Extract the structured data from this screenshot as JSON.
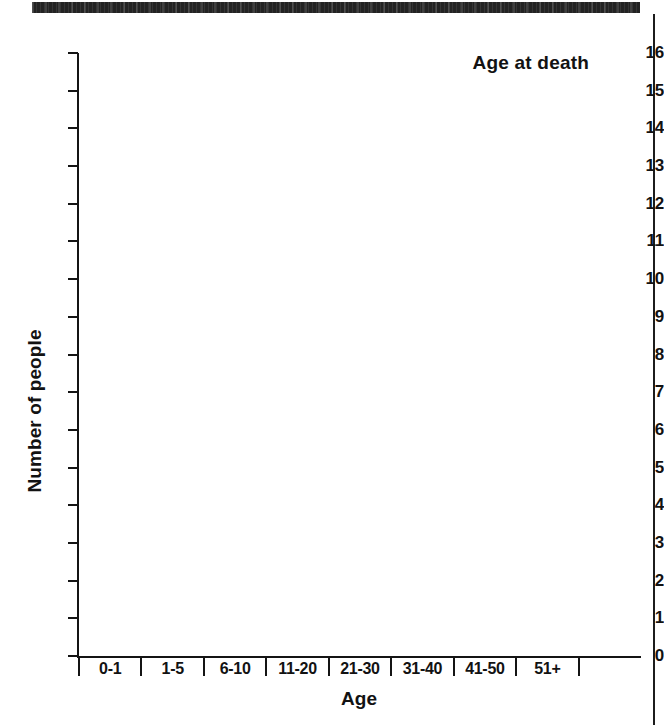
{
  "document": {
    "scan_header_bar": "",
    "right_margin_rule": ""
  },
  "chart_data": {
    "type": "bar",
    "title": "Age at death",
    "xlabel": "Age",
    "ylabel": "Number of people",
    "categories": [
      "0-1",
      "1-5",
      "6-10",
      "11-20",
      "21-30",
      "31-40",
      "41-50",
      "51+"
    ],
    "values": [
      0,
      0,
      0,
      0,
      0,
      0,
      0,
      0
    ],
    "ylim": [
      0,
      16
    ],
    "ytick_labels": [
      "16",
      "15",
      "14",
      "13",
      "12",
      "11",
      "10",
      "9",
      "8",
      "7",
      "6",
      "5",
      "4",
      "3",
      "2",
      "1",
      "0"
    ],
    "ytick_values": [
      16,
      15,
      14,
      13,
      12,
      11,
      10,
      9,
      8,
      7,
      6,
      5,
      4,
      3,
      2,
      1,
      0
    ],
    "grid": false,
    "legend": null
  }
}
